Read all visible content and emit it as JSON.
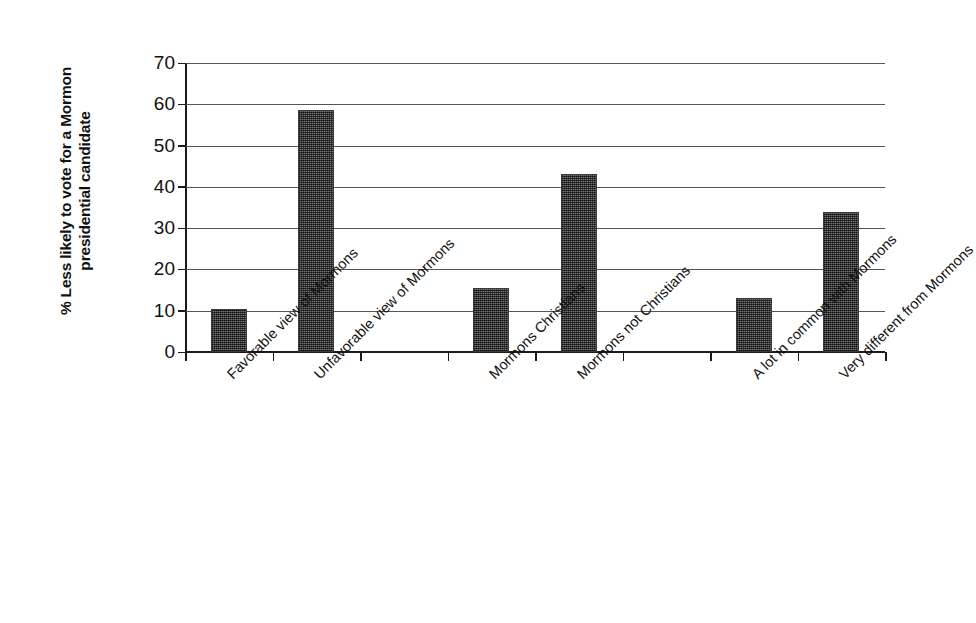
{
  "chart_data": {
    "type": "bar",
    "title": "",
    "xlabel": "",
    "ylabel": "% Less likely to vote for a Mormon presidential candidate",
    "ylabel_line1": "% Less likely to vote for a Mormon",
    "ylabel_line2": "presidential candidate",
    "categories": [
      "Favorable view of Mormons",
      "Unfavorable view of Mormons",
      "Mormons Christians",
      "Mormons not Christians",
      "A lot in common with Mormons",
      "Very different from Mormons"
    ],
    "values": [
      10.5,
      58.5,
      15.5,
      43,
      13,
      34
    ],
    "ylim": [
      0,
      70
    ],
    "yticks": [
      0,
      10,
      20,
      30,
      40,
      50,
      60,
      70
    ],
    "ytick_labels": [
      "0",
      "10",
      "20",
      "30",
      "40",
      "50",
      "60",
      "70"
    ],
    "grid": true,
    "legend": "none",
    "bar_color": "#4d4d4d",
    "axis_color": "#1a1a1a",
    "gridline_color": "#555555",
    "background_color": "#ffffff",
    "group_gaps_after": [
      2,
      4
    ]
  }
}
